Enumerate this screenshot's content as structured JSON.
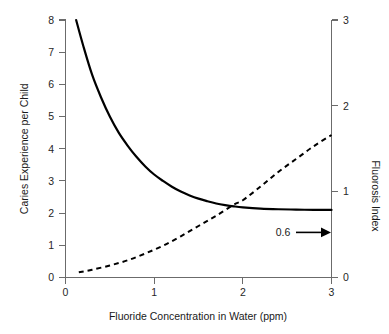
{
  "chart_data": {
    "type": "line",
    "title": "",
    "subtitle": "",
    "xlabel": "Fluoride Concentration in Water (ppm)",
    "ylabel": "Caries Experience per Child",
    "y2label": "Fluorosis Index",
    "xlim": [
      0,
      3
    ],
    "ylim": [
      0,
      8
    ],
    "y2lim": [
      0,
      3
    ],
    "xticks": [
      0,
      1,
      2,
      3
    ],
    "xticklabels": [
      "0",
      "1",
      "2",
      "3"
    ],
    "yticks": [
      0,
      1,
      2,
      3,
      4,
      5,
      6,
      7,
      8
    ],
    "yticklabels": [
      "0",
      "1",
      "2",
      "3",
      "4",
      "5",
      "6",
      "7",
      "8"
    ],
    "y2ticks": [
      0,
      1,
      2,
      3
    ],
    "y2ticklabels": [
      "0",
      "1",
      "2",
      "3"
    ],
    "grid": false,
    "legend": "none",
    "series": [
      {
        "name": "Caries Experience per Child",
        "axis": "left",
        "style": "solid",
        "color": "#000000",
        "x": [
          0.12,
          0.2,
          0.3,
          0.4,
          0.5,
          0.6,
          0.7,
          0.8,
          0.9,
          1.0,
          1.1,
          1.2,
          1.3,
          1.4,
          1.5,
          1.6,
          1.7,
          1.8,
          1.9,
          2.0,
          2.2,
          2.4,
          2.6,
          2.8,
          3.0
        ],
        "y": [
          8.0,
          7.2,
          6.3,
          5.6,
          5.0,
          4.5,
          4.1,
          3.75,
          3.45,
          3.2,
          3.0,
          2.82,
          2.67,
          2.55,
          2.45,
          2.37,
          2.3,
          2.25,
          2.21,
          2.18,
          2.14,
          2.12,
          2.11,
          2.1,
          2.1
        ]
      },
      {
        "name": "Fluorosis Index",
        "axis": "right",
        "style": "dashed",
        "color": "#000000",
        "x": [
          0.15,
          0.3,
          0.5,
          0.7,
          0.9,
          1.1,
          1.3,
          1.5,
          1.7,
          1.9,
          2.0,
          2.2,
          2.4,
          2.6,
          2.8,
          3.0
        ],
        "y2": [
          0.06,
          0.09,
          0.14,
          0.2,
          0.28,
          0.37,
          0.48,
          0.6,
          0.72,
          0.85,
          0.9,
          1.06,
          1.23,
          1.38,
          1.53,
          1.66
        ]
      }
    ],
    "annotations": [
      {
        "text": "0.6",
        "x": 2.3,
        "y": 1.35,
        "icon": "right-arrow-icon",
        "points_to": "right-axis"
      }
    ]
  }
}
